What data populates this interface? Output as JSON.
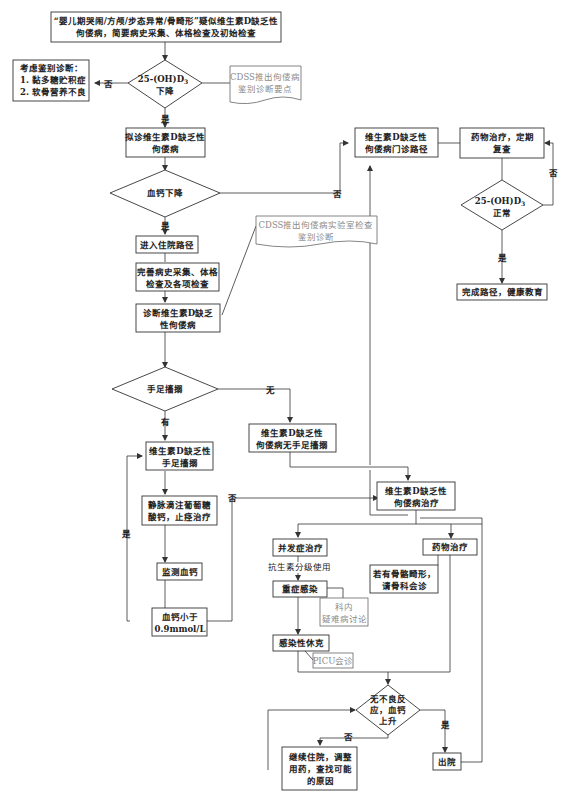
{
  "diagram": {
    "type": "flowchart",
    "nodes": {
      "start": {
        "line1": "“婴儿期哭闹/方颅/步态异常/骨畸形”疑似维生素D缺乏性",
        "line2": "佝偻病，简要病史采集、体格检查及初始检查"
      },
      "diff_dx": {
        "line1": "考虑鉴别诊断：",
        "line2": "1. 黏多糖贮积症",
        "line3": "2. 软骨营养不良"
      },
      "d3_decrease": {
        "line1": "25-(OH)D",
        "sub": "3",
        "line2": "下降"
      },
      "cdss_1": {
        "line1": "CDSS推出佝偻病",
        "line2": "鉴别诊断要点"
      },
      "suspect_dx": {
        "line1": "拟诊维生素D缺乏性",
        "line2": "佝偻病"
      },
      "ca_decrease": {
        "line1": "血钙下降"
      },
      "outpatient": {
        "line1": "维生素D缺乏性",
        "line2": "佝偻病门诊路径"
      },
      "drug_followup": {
        "line1": "药物治疗，定期",
        "line2": "复查"
      },
      "d3_normal": {
        "line1": "25-(OH)D",
        "sub": "3",
        "line2": "正常"
      },
      "complete": {
        "line1": "完成路径，健康教育"
      },
      "admit": {
        "line1": "进入住院路径"
      },
      "cdss_2": {
        "line1": "CDSS推出佝偻病实验室检查",
        "line2": "鉴别诊断"
      },
      "workup": {
        "line1": "完善病史采集、体格",
        "line2": "检查及各项检查"
      },
      "confirm_dx": {
        "line1": "诊断维生素D缺乏",
        "line2": "性佝偻病"
      },
      "tetany": {
        "line1": "手足搐搦"
      },
      "no_tetany": {
        "line1": "维生素D缺乏性",
        "line2": "佝偻病无手足搐搦"
      },
      "with_tetany": {
        "line1": "维生素D缺乏性",
        "line2": "手足搐搦"
      },
      "iv_ca": {
        "line1": "静脉滴注葡萄糖",
        "line2": "酸钙，止痉治疗"
      },
      "monitor_ca": {
        "line1": "监测血钙"
      },
      "ca_low": {
        "line1": "血钙小于",
        "line2": "0.9mmol/L"
      },
      "treatment": {
        "line1": "维生素D缺乏性",
        "line2": "佝偻病治疗"
      },
      "complication": {
        "line1": "并发症治疗"
      },
      "antibiotic": {
        "line1": "抗生素分级使用"
      },
      "severe_inf": {
        "line1": "重症感染"
      },
      "dept_discuss": {
        "line1": "科内",
        "line2": "疑难病讨论"
      },
      "septic_shock": {
        "line1": "感染性休克"
      },
      "picu": {
        "line1": "PICU会诊"
      },
      "drug_tx": {
        "line1": "药物治疗"
      },
      "ortho": {
        "line1": "若有骨骼畸形，",
        "line2": "请骨科会诊"
      },
      "no_adverse": {
        "line1": "无不良反",
        "line2": "应，血钙",
        "line3": "上升"
      },
      "continue": {
        "line1": "继续住院，调整",
        "line2": "用药，查找可能",
        "line3": "的原因"
      },
      "discharge": {
        "line1": "出院"
      }
    },
    "edge_labels": {
      "no": "否",
      "yes": "是",
      "none": "无",
      "has": "有"
    },
    "colors": {
      "line": "#333333",
      "text": "#222222",
      "cdss_text": "#8a8a8a",
      "background": "#ffffff"
    }
  }
}
